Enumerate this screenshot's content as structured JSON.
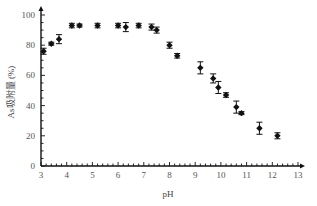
{
  "chart_data": {
    "type": "scatter",
    "title": "",
    "xlabel": "pH",
    "ylabel": "As吸附量 (%)",
    "xlim": [
      3,
      13
    ],
    "ylim": [
      0,
      100
    ],
    "xticks": [
      "3",
      "4",
      "5",
      "6",
      "7",
      "8",
      "9",
      "10",
      "11",
      "12",
      "13"
    ],
    "yticks": [
      "0",
      "20",
      "40",
      "60",
      "80",
      "100"
    ],
    "grid": false,
    "legend": "none",
    "series": [
      {
        "name": "As adsorption",
        "marker": "diamond-with-errorbar",
        "color": "#111111",
        "x": [
          3.1,
          3.4,
          3.7,
          4.2,
          4.5,
          5.2,
          6.0,
          6.3,
          6.8,
          7.3,
          7.5,
          8.0,
          8.3,
          9.2,
          9.7,
          9.9,
          10.2,
          10.6,
          10.8,
          11.5,
          12.2
        ],
        "y": [
          76,
          81,
          84,
          93,
          93,
          93,
          93,
          92,
          93,
          92,
          90,
          80,
          73,
          65,
          58,
          52,
          47,
          39,
          35,
          25,
          20
        ],
        "err": [
          2,
          1,
          3,
          1.5,
          1,
          1.5,
          1.5,
          3,
          1.5,
          2,
          2,
          2,
          1.5,
          4,
          3,
          4,
          1.5,
          4,
          1,
          4,
          2
        ]
      }
    ]
  }
}
